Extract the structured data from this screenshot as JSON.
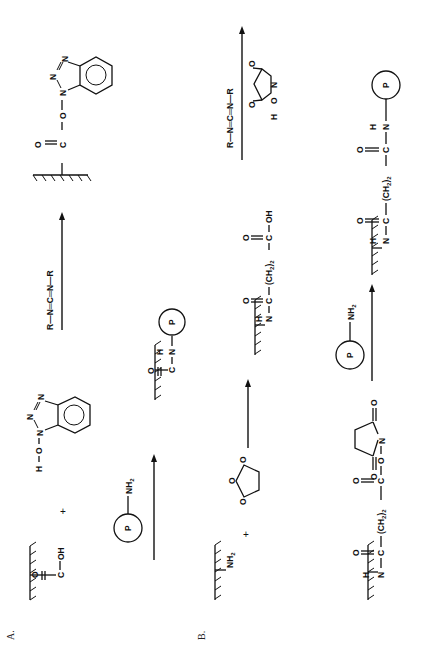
{
  "figure": {
    "orientation": "rotated-90-ccw",
    "panels": [
      {
        "id": "A",
        "label": "A.",
        "reactants": {
          "surface_acid": {
            "groups": [
              "O",
              "C",
              "OH"
            ],
            "text": "O=C-OH"
          },
          "plus": "+",
          "hobt": {
            "h": "H",
            "o": "O",
            "n1": "N",
            "n2": "N",
            "n3": "N",
            "text": "H-O-N(benzotriazole)"
          }
        },
        "reagent_1": {
          "text": "R—N═C═N—R",
          "r1": "R",
          "n1": "N",
          "c": "C",
          "n2": "N",
          "r2": "R"
        },
        "intermediate": {
          "o_carbonyl": "O",
          "c": "C",
          "o_link": "O",
          "n1": "N",
          "n2": "N",
          "n3": "N",
          "text": "O=C-O-N(benzotriazole ester)"
        },
        "reagent_2": {
          "p": "P",
          "nh2": "NH",
          "sub2": "2"
        },
        "product": {
          "o": "O",
          "c": "C",
          "h": "H",
          "n": "N",
          "p": "P"
        }
      },
      {
        "id": "B",
        "label": "B.",
        "reactants": {
          "surface_amine": {
            "nh2": "NH",
            "sub2": "2"
          },
          "plus": "+",
          "succinic_anhydride": {
            "o_ring": "O",
            "o_left": "O",
            "o_right": "O"
          }
        },
        "intermediate_acid": {
          "h": "H",
          "n": "N",
          "o1": "O",
          "c1": "C",
          "ch2": "(CH",
          "sub2": "2",
          "close": ")",
          "sub2b": "2",
          "o2": "O",
          "c2": "C",
          "oh": "OH"
        },
        "reagent_1": {
          "text": "R—N═C═N—R",
          "r1": "R",
          "n1": "N",
          "c": "C",
          "n2": "N",
          "r2": "R"
        },
        "nhs": {
          "h": "H",
          "o": "O",
          "n": "N",
          "o_left": "O",
          "o_right": "O"
        },
        "nhs_ester": {
          "h": "H",
          "n": "N",
          "o1": "O",
          "c1": "C",
          "ch2": "(CH",
          "sub2": "2",
          "close": ")",
          "sub2b": "2",
          "o2": "O",
          "c2": "C",
          "o_link": "O",
          "n_ring": "N",
          "o_left": "O",
          "o_right": "O"
        },
        "reagent_2": {
          "p": "P",
          "nh2": "NH",
          "sub2": "2"
        },
        "product": {
          "h": "H",
          "n": "N",
          "o1": "O",
          "c1": "C",
          "ch2": "(CH",
          "sub2": "2",
          "close": ")",
          "sub2b": "2",
          "o2": "O",
          "c2": "C",
          "h2": "H",
          "n2": "N",
          "p": "P"
        }
      }
    ]
  },
  "colors": {
    "ink": "#111111",
    "background": "#ffffff"
  }
}
